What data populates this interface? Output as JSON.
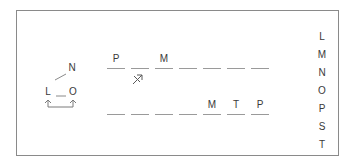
{
  "diagram": {
    "nodes": [
      {
        "id": "N",
        "label": "N"
      },
      {
        "id": "L",
        "label": "L"
      },
      {
        "id": "O",
        "label": "O"
      }
    ],
    "top_row": {
      "slots": [
        "P",
        "",
        "M",
        "",
        "",
        "",
        ""
      ],
      "crossed_arrow_under_slot": 2
    },
    "bottom_row": {
      "slots": [
        "",
        "",
        "",
        "",
        "M",
        "T",
        "P"
      ]
    },
    "key_letters": [
      "L",
      "M",
      "N",
      "O",
      "P",
      "S",
      "T"
    ]
  }
}
